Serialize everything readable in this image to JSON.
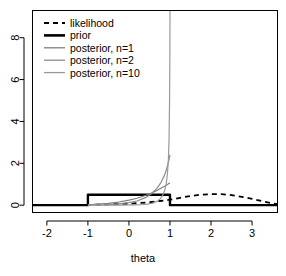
{
  "chart_data": {
    "type": "line",
    "title": "",
    "xlabel": "theta",
    "ylabel": "",
    "xlim": [
      -2.35,
      3.62
    ],
    "ylim": [
      -0.35,
      9.3
    ],
    "xticks": [
      -2,
      -1,
      0,
      1,
      2,
      3
    ],
    "xtick_labels": [
      "-2",
      "-1",
      "0",
      "1",
      "2",
      "3"
    ],
    "yticks": [
      0,
      2,
      4,
      6,
      8
    ],
    "ytick_labels": [
      "0",
      "2",
      "4",
      "6",
      "8"
    ],
    "grid": false,
    "legend_position": "top-left",
    "series": [
      {
        "name": "likelihood",
        "label": "likelihood",
        "color": "#000000",
        "style": "dashed",
        "width": 1.8,
        "x": [
          -2.35,
          -2.0,
          -1.5,
          -1.0,
          -0.5,
          0.0,
          0.25,
          0.5,
          0.75,
          1.0,
          1.25,
          1.5,
          1.75,
          2.0,
          2.25,
          2.5,
          2.75,
          3.0,
          3.25,
          3.5,
          3.62
        ],
        "y": [
          0.0,
          0.0,
          0.005,
          0.015,
          0.035,
          0.07,
          0.1,
          0.14,
          0.2,
          0.26,
          0.35,
          0.44,
          0.5,
          0.53,
          0.53,
          0.48,
          0.4,
          0.3,
          0.19,
          0.09,
          0.05
        ]
      },
      {
        "name": "prior",
        "label": "prior",
        "color": "#000000",
        "style": "solid",
        "width": 2.4,
        "x": [
          -2.35,
          -1.0,
          -1.0,
          1.0,
          1.0,
          3.62
        ],
        "y": [
          0.0,
          0.0,
          0.5,
          0.5,
          0.0,
          0.0
        ]
      },
      {
        "name": "posterior_n1",
        "label": "posterior, n=1",
        "color": "#7f7f7f",
        "style": "solid",
        "width": 1.2,
        "x": [
          -1.0,
          -0.75,
          -0.5,
          -0.25,
          0.0,
          0.2,
          0.4,
          0.55,
          0.7,
          0.8,
          0.88,
          0.94,
          0.97,
          1.0
        ],
        "y": [
          0.02,
          0.05,
          0.09,
          0.15,
          0.24,
          0.33,
          0.46,
          0.58,
          0.72,
          0.83,
          0.92,
          0.99,
          1.03,
          1.06
        ]
      },
      {
        "name": "posterior_n2",
        "label": "posterior, n=2",
        "color": "#8c8c8c",
        "style": "solid",
        "width": 1.2,
        "x": [
          -1.0,
          -0.6,
          -0.3,
          0.0,
          0.2,
          0.4,
          0.55,
          0.68,
          0.78,
          0.86,
          0.91,
          0.95,
          0.98,
          1.0
        ],
        "y": [
          0.0,
          0.02,
          0.05,
          0.12,
          0.2,
          0.36,
          0.55,
          0.8,
          1.08,
          1.4,
          1.68,
          1.96,
          2.2,
          2.4
        ]
      },
      {
        "name": "posterior_n10",
        "label": "posterior, n=10",
        "color": "#999999",
        "style": "solid",
        "width": 1.2,
        "x": [
          -1.0,
          -0.2,
          0.1,
          0.3,
          0.45,
          0.58,
          0.68,
          0.76,
          0.82,
          0.87,
          0.91,
          0.94,
          0.962,
          0.978,
          0.99,
          0.997,
          1.0,
          1.0
        ],
        "y": [
          0.0,
          0.0,
          0.01,
          0.02,
          0.05,
          0.1,
          0.18,
          0.3,
          0.46,
          0.7,
          1.05,
          1.55,
          2.2,
          3.2,
          5.0,
          7.0,
          9.0,
          9.3
        ]
      }
    ],
    "legend_entries": [
      {
        "label": "likelihood",
        "color": "#000000",
        "style": "dashed",
        "width": 1.8
      },
      {
        "label": "prior",
        "color": "#000000",
        "style": "solid",
        "width": 2.6
      },
      {
        "label": "posterior, n=1",
        "color": "#7f7f7f",
        "style": "solid",
        "width": 1.3
      },
      {
        "label": "posterior, n=2",
        "color": "#8c8c8c",
        "style": "solid",
        "width": 1.3
      },
      {
        "label": "posterior, n=10",
        "color": "#999999",
        "style": "solid",
        "width": 1.3
      }
    ]
  }
}
